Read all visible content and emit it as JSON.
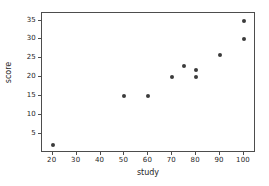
{
  "chart_data": {
    "type": "scatter",
    "title": "",
    "xlabel": "study",
    "ylabel": "score",
    "xlim": [
      15.5,
      105
    ],
    "ylim": [
      0.0,
      37.0
    ],
    "xticks": [
      20,
      30,
      40,
      50,
      60,
      70,
      80,
      90,
      100
    ],
    "xticklabels": [
      "20",
      "30",
      "40",
      "50",
      "60",
      "70",
      "80",
      "90",
      "100"
    ],
    "yticks": [
      5,
      10,
      15,
      20,
      25,
      30,
      35
    ],
    "yticklabels": [
      "5",
      "10",
      "15",
      "20",
      "25",
      "30",
      "35"
    ],
    "grid": false,
    "legend": false,
    "marker": "circle",
    "marker_color": "#3b3b3b",
    "background_color": "#ffffff",
    "axes_color": "#4d4d4d",
    "points": [
      {
        "x": 20,
        "y": 2
      },
      {
        "x": 50,
        "y": 15
      },
      {
        "x": 60,
        "y": 15
      },
      {
        "x": 70,
        "y": 20
      },
      {
        "x": 75,
        "y": 23
      },
      {
        "x": 80,
        "y": 20
      },
      {
        "x": 80,
        "y": 22
      },
      {
        "x": 90,
        "y": 26
      },
      {
        "x": 100,
        "y": 30
      },
      {
        "x": 100,
        "y": 35
      }
    ]
  }
}
